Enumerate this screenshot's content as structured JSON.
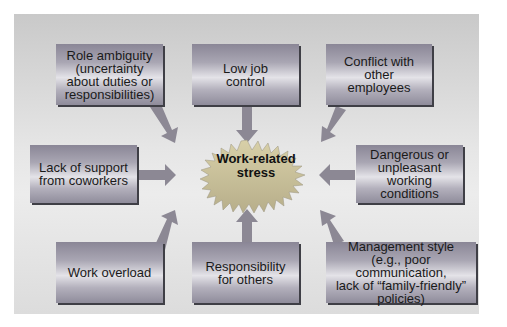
{
  "diagram": {
    "center": {
      "line1": "Work-related",
      "line2": "stress"
    },
    "causes": [
      {
        "id": "role-ambiguity",
        "lines": [
          "Role ambiguity",
          "(uncertainty",
          "about duties or",
          "responsibilities)"
        ]
      },
      {
        "id": "low-job-control",
        "lines": [
          "Low job",
          "control"
        ]
      },
      {
        "id": "conflict-with-employees",
        "lines": [
          "Conflict with",
          "other",
          "employees"
        ]
      },
      {
        "id": "lack-of-support",
        "lines": [
          "Lack of support",
          "from coworkers"
        ]
      },
      {
        "id": "dangerous-conditions",
        "lines": [
          "Dangerous or",
          "unpleasant working",
          "conditions"
        ]
      },
      {
        "id": "work-overload",
        "lines": [
          "Work overload"
        ]
      },
      {
        "id": "responsibility-for-others",
        "lines": [
          "Responsibility",
          "for others"
        ]
      },
      {
        "id": "management-style",
        "lines": [
          "Management style",
          "(e.g., poor communication,",
          "lack of “family-friendly”",
          "policies)"
        ]
      }
    ],
    "colors": {
      "background": "#e2e2e2",
      "box": "#a9a6b3",
      "box_highlight": "#e4e3e8",
      "arrow": "#8c8894",
      "burst": "#c9c1a0",
      "text": "#1a1a1a"
    }
  }
}
